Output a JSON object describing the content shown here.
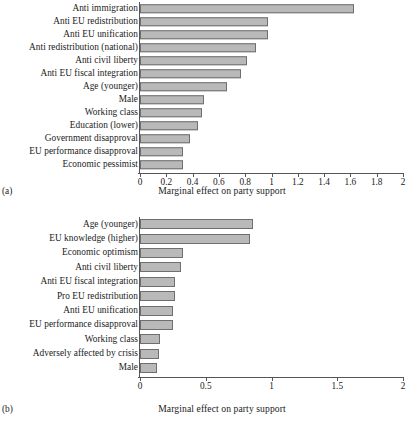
{
  "figure": {
    "axis_title": "Marginal effect on party support",
    "bar_fill": "#b9b9b9",
    "bar_edge": "#6f6f6f"
  },
  "panels": [
    {
      "tag": "(a)",
      "xlabel": "Marginal effect on party support",
      "xlim": [
        0,
        2
      ],
      "xticks": [
        "0",
        "0.2",
        "0.4",
        "0.6",
        "0.8",
        "1",
        "1.2",
        "1.4",
        "1.6",
        "1.8",
        "2"
      ],
      "xtick_values": [
        0,
        0.2,
        0.4,
        0.6,
        0.8,
        1,
        1.2,
        1.4,
        1.6,
        1.8,
        2
      ],
      "categories": [
        "Anti immigration",
        "Anti EU redistribution",
        "Anti EU unification",
        "Anti redistribution (national)",
        "Anti civil liberty",
        "Anti EU fiscal integration",
        "Age (younger)",
        "Male",
        "Working class",
        "Education (lower)",
        "Government disapproval",
        "EU performance disapproval",
        "Economic pessimist"
      ],
      "values": [
        1.63,
        0.97,
        0.97,
        0.88,
        0.81,
        0.77,
        0.66,
        0.49,
        0.47,
        0.44,
        0.38,
        0.33,
        0.33
      ]
    },
    {
      "tag": "(b)",
      "xlabel": "Marginal effect on party support",
      "xlim": [
        0,
        2
      ],
      "xticks": [
        "0",
        "0.5",
        "1",
        "1.5",
        "2"
      ],
      "xtick_values": [
        0,
        0.5,
        1,
        1.5,
        2
      ],
      "categories": [
        "Age (younger)",
        "EU knowledge (higher)",
        "Economic optimism",
        "Anti civil liberty",
        "Anti EU fiscal integration",
        "Pro EU redistribution",
        "Anti EU unification",
        "EU performance disapproval",
        "Working class",
        "Adversely affected by crisis",
        "Male"
      ],
      "values": [
        0.86,
        0.84,
        0.33,
        0.31,
        0.265,
        0.265,
        0.25,
        0.25,
        0.15,
        0.145,
        0.13
      ]
    }
  ],
  "chart_data": [
    {
      "type": "bar",
      "orientation": "horizontal",
      "panel": "(a)",
      "title": "",
      "xlabel": "Marginal effect on party support",
      "ylabel": "",
      "xlim": [
        0,
        2
      ],
      "xtick_labels": [
        "0",
        "0.2",
        "0.4",
        "0.6",
        "0.8",
        "1",
        "1.2",
        "1.4",
        "1.6",
        "1.8",
        "2"
      ],
      "grid": false,
      "legend": "none",
      "categories": [
        "Anti immigration",
        "Anti EU redistribution",
        "Anti EU unification",
        "Anti redistribution (national)",
        "Anti civil liberty",
        "Anti EU fiscal integration",
        "Age (younger)",
        "Male",
        "Working class",
        "Education (lower)",
        "Government disapproval",
        "EU performance disapproval",
        "Economic pessimist"
      ],
      "values": [
        1.63,
        0.97,
        0.97,
        0.88,
        0.81,
        0.77,
        0.66,
        0.49,
        0.47,
        0.44,
        0.38,
        0.33,
        0.33
      ]
    },
    {
      "type": "bar",
      "orientation": "horizontal",
      "panel": "(b)",
      "title": "",
      "xlabel": "Marginal effect on party support",
      "ylabel": "",
      "xlim": [
        0,
        2
      ],
      "xtick_labels": [
        "0",
        "0.5",
        "1",
        "1.5",
        "2"
      ],
      "grid": false,
      "legend": "none",
      "categories": [
        "Age (younger)",
        "EU knowledge (higher)",
        "Economic optimism",
        "Anti civil liberty",
        "Anti EU fiscal integration",
        "Pro EU redistribution",
        "Anti EU unification",
        "EU performance disapproval",
        "Working class",
        "Adversely affected by crisis",
        "Male"
      ],
      "values": [
        0.86,
        0.84,
        0.33,
        0.31,
        0.265,
        0.265,
        0.25,
        0.25,
        0.15,
        0.145,
        0.13
      ]
    }
  ]
}
